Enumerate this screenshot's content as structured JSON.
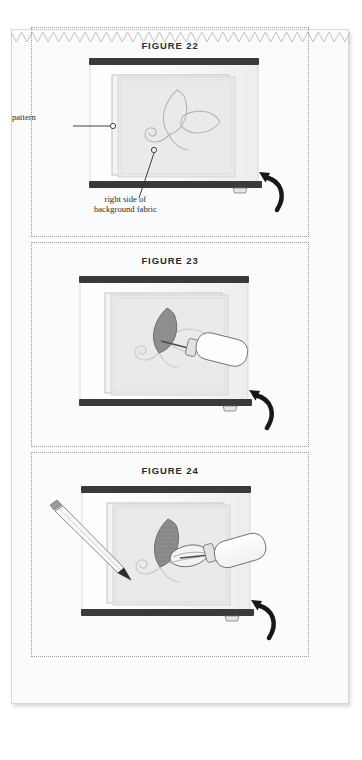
{
  "page": {
    "background_color": "#fbfbfb",
    "border_color": "#d8d8d8",
    "decoration": "sawtooth-edge-top"
  },
  "colors": {
    "ink": "#2b2b2b",
    "frame_dark": "#3a3a3a",
    "hoop_fill": "#f2f2f2",
    "fabric_fill": "#ececec",
    "pattern_line": "#b9b9b9",
    "leaf_dark": "#8a8a8a",
    "dotted_border": "#9a9a9a",
    "tool_body": "#fdfdfd",
    "tool_outline": "#6e6e6e",
    "pencil_body": "#f6f6f6"
  },
  "panels": [
    {
      "id": "figure-22",
      "title": "FIGURE 22",
      "callouts": [
        {
          "name": "pattern",
          "label": "pattern"
        },
        {
          "name": "background-fabric",
          "label": "right side of\nbackground fabric",
          "line1": "right side of",
          "line2": "background fabric"
        }
      ],
      "elements": {
        "frame": "embroidery-frame",
        "pattern_motif": "two-leaf-vine-outline",
        "hook": "curved-hook-right"
      }
    },
    {
      "id": "figure-23",
      "title": "FIGURE 23",
      "callouts": [],
      "elements": {
        "frame": "embroidery-frame",
        "pattern_motif": "two-leaf-vine-outline",
        "applique_leaf": "dark-filled-leaf",
        "tool": "stylus-tool",
        "hook": "curved-hook-right"
      }
    },
    {
      "id": "figure-24",
      "title": "FIGURE 24",
      "callouts": [],
      "elements": {
        "frame": "embroidery-frame",
        "pattern_motif": "two-leaf-vine-outline",
        "applique_leaf": "dark-textured-leaf",
        "second_leaf": "light-leaf-being-placed",
        "tool": "stylus-tool",
        "pencil": "pencil-tracing",
        "hook": "curved-hook-right"
      }
    }
  ]
}
